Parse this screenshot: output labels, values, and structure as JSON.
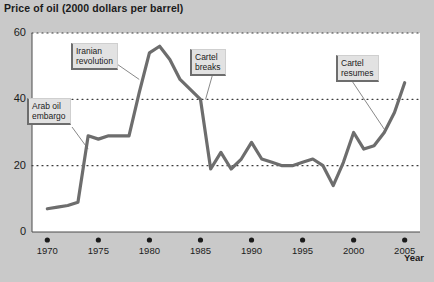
{
  "chart_data": {
    "type": "line",
    "title": "Price of oil (2000 dollars per barrel)",
    "xlabel": "Year",
    "ylabel": "",
    "xlim": [
      1968.5,
      2006.5
    ],
    "ylim": [
      0,
      60
    ],
    "grid": true,
    "legend": null,
    "ytick_labels": [
      "0",
      "20",
      "40",
      "60"
    ],
    "ytick_values": [
      0,
      20,
      40,
      60
    ],
    "xtick_labels": [
      "1970",
      "1975",
      "1980",
      "1985",
      "1990",
      "1995",
      "2000",
      "2005"
    ],
    "xtick_values": [
      1970,
      1975,
      1980,
      1985,
      1990,
      1995,
      2000,
      2005
    ],
    "line_color": "#6d6d6d",
    "x": [
      1970,
      1971,
      1972,
      1973,
      1974,
      1975,
      1976,
      1977,
      1978,
      1979,
      1980,
      1981,
      1982,
      1983,
      1984,
      1985,
      1986,
      1987,
      1988,
      1989,
      1990,
      1991,
      1992,
      1993,
      1994,
      1995,
      1996,
      1997,
      1998,
      1999,
      2000,
      2001,
      2002,
      2003,
      2004,
      2005
    ],
    "values": [
      7,
      7.5,
      8,
      9,
      29,
      28,
      29,
      29,
      29,
      42,
      54,
      56,
      52,
      46,
      43,
      40,
      19,
      24,
      19,
      22,
      27,
      22,
      21,
      20,
      20,
      21,
      22,
      20,
      14,
      21,
      30,
      25,
      26,
      30,
      36,
      45
    ],
    "annotations": [
      {
        "label": "Arab oil\nembargo",
        "points_to_year": 1974,
        "points_to_value": 25
      },
      {
        "label": "Iranian\nrevolution",
        "points_to_year": 1979,
        "points_to_value": 46
      },
      {
        "label": "Cartel\nbreaks",
        "points_to_year": 1985.5,
        "points_to_value": 40
      },
      {
        "label": "Cartel\nresumes",
        "points_to_year": 2003,
        "points_to_value": 31
      }
    ]
  },
  "source_note": ""
}
